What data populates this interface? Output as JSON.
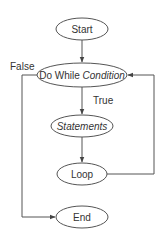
{
  "diagram": {
    "type": "flowchart",
    "nodes": {
      "start": {
        "label": "Start"
      },
      "condition": {
        "label_prefix": "Do While ",
        "label_italic": "Condition"
      },
      "statements": {
        "label": "Statements"
      },
      "loop": {
        "label": "Loop"
      },
      "end": {
        "label": "End"
      }
    },
    "edges": {
      "start_to_condition": {
        "label": ""
      },
      "condition_true": {
        "label": "True"
      },
      "condition_false": {
        "label": "False"
      },
      "statements_to_loop": {
        "label": ""
      },
      "loop_back": {
        "label": ""
      }
    },
    "colors": {
      "stroke": "#555555",
      "text": "#333333",
      "background": "#ffffff"
    }
  }
}
